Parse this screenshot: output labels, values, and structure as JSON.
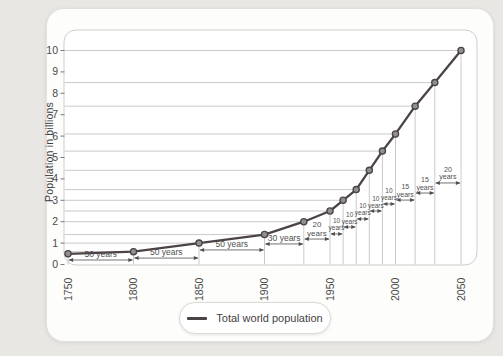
{
  "colors": {
    "curve": "#4b4345",
    "marker_fill": "#909090",
    "marker_stroke": "#4b4345",
    "guide_line": "#bdbdbd",
    "border": "#cfcdc9",
    "tick_text": "#4a4a4a",
    "annotation": "#4f4f4f"
  },
  "y_axis": {
    "title": "Population in billions",
    "ticks": [
      "0",
      "1",
      "2",
      "3",
      "4",
      "5",
      "6",
      "7",
      "8",
      "9",
      "10"
    ]
  },
  "x_axis": {
    "labels": [
      "1750",
      "1800",
      "1850",
      "1900",
      "1950",
      "2000",
      "2050"
    ]
  },
  "legend": {
    "label": "Total world population"
  },
  "chart_data": {
    "type": "line",
    "series_name": "Total world population",
    "ylabel": "Population in billions",
    "xlim": [
      1750,
      2050
    ],
    "ylim": [
      0,
      10
    ],
    "grid": "per-point horizontal and vertical guide lines",
    "legend_position": "bottom",
    "x": [
      1750,
      1800,
      1850,
      1900,
      1930,
      1950,
      1960,
      1970,
      1980,
      1990,
      2000,
      2015,
      2030,
      2050
    ],
    "values": [
      0.5,
      0.6,
      1.0,
      1.4,
      2.0,
      2.5,
      3.0,
      3.5,
      4.4,
      5.3,
      6.1,
      7.4,
      8.5,
      10.0
    ],
    "intervals": [
      {
        "from": 1750,
        "to": 1800,
        "label": "50 years",
        "stacked": false,
        "h": 0.21,
        "fs": 8.5
      },
      {
        "from": 1800,
        "to": 1850,
        "label": "50 years",
        "stacked": false,
        "h": 0.3,
        "fs": 8.5
      },
      {
        "from": 1850,
        "to": 1900,
        "label": "50 years",
        "stacked": false,
        "h": 0.68,
        "fs": 8.5
      },
      {
        "from": 1900,
        "to": 1930,
        "label": "30 years",
        "stacked": false,
        "h": 0.96,
        "fs": 8.5
      },
      {
        "from": 1930,
        "to": 1950,
        "label": "20 years",
        "stacked": true,
        "h": 1.19,
        "fs": 8
      },
      {
        "from": 1950,
        "to": 1960,
        "label": "10 years",
        "stacked": true,
        "h": 1.43,
        "fs": 6.5
      },
      {
        "from": 1960,
        "to": 1970,
        "label": "10 years",
        "stacked": true,
        "h": 1.75,
        "fs": 6.5
      },
      {
        "from": 1970,
        "to": 1980,
        "label": "10 years",
        "stacked": true,
        "h": 2.13,
        "fs": 6.5
      },
      {
        "from": 1980,
        "to": 1990,
        "label": "10 years",
        "stacked": true,
        "h": 2.5,
        "fs": 6.5
      },
      {
        "from": 1990,
        "to": 2000,
        "label": "10 years",
        "stacked": true,
        "h": 2.83,
        "fs": 6.5
      },
      {
        "from": 2000,
        "to": 2015,
        "label": "15 years",
        "stacked": true,
        "h": 3.01,
        "fs": 7
      },
      {
        "from": 2015,
        "to": 2030,
        "label": "15 years",
        "stacked": true,
        "h": 3.34,
        "fs": 7
      },
      {
        "from": 2030,
        "to": 2050,
        "label": "20 years",
        "stacked": true,
        "h": 3.81,
        "fs": 7
      }
    ]
  }
}
